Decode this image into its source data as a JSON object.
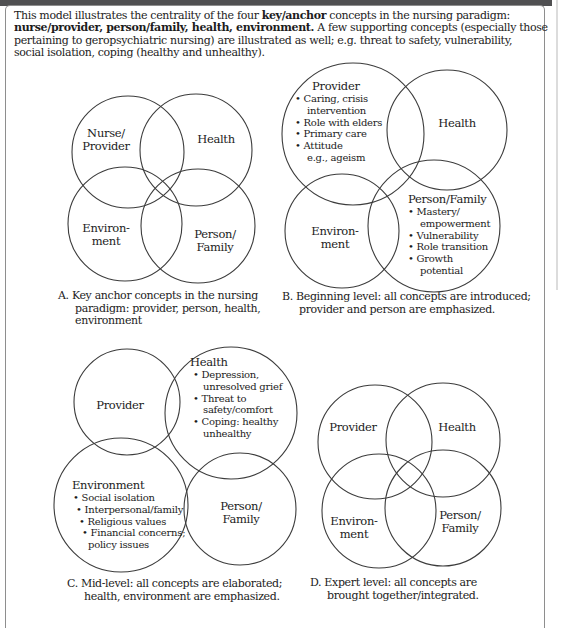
{
  "colors": {
    "ink": "#1c1c1c",
    "circle_stroke": "#3c3c3c",
    "frame_border": "#8e8e8e",
    "top_bar": "#505052",
    "background": "#ffffff"
  },
  "intro": {
    "line1_a": "This model illustrates the centrality of the four ",
    "line1_b": "key/anchor",
    "line1_c": " concepts in the nursing paradigm:",
    "line2_a": "nurse/provider, person/family, health, environment.",
    "line2_b": " A few supporting concepts (especially those",
    "line3": "pertaining to geropsychiatric nursing) are illustrated as well; e.g. threat to safety, vulnerability,",
    "line4": "social isolation, coping (healthy and unhealthy)."
  },
  "panel_a": {
    "labels": {
      "nurse_provider_1": "Nurse/",
      "nurse_provider_2": "Provider",
      "health": "Health",
      "environment_1": "Environ-",
      "environment_2": "ment",
      "person_family_1": "Person/",
      "person_family_2": "Family"
    },
    "caption_1": "A. Key anchor concepts in the nursing",
    "caption_2": "paradigm: provider, person, health,",
    "caption_3": "environment"
  },
  "panel_b": {
    "provider_title": "Provider",
    "provider_bullets": [
      "• Caring, crisis",
      "intervention",
      "• Role with elders",
      "• Primary care",
      "• Attitude",
      "e.g., ageism"
    ],
    "health": "Health",
    "environment_1": "Environ-",
    "environment_2": "ment",
    "person_family_title": "Person/Family",
    "person_family_bullets": [
      "• Mastery/",
      "empowerment",
      "• Vulnerability",
      "• Role transition",
      "• Growth",
      "potential"
    ],
    "caption_1": "B. Beginning level: all concepts are introduced;",
    "caption_2": "provider and person are emphasized."
  },
  "panel_c": {
    "provider": "Provider",
    "health_title": "Health",
    "health_bullets": [
      "• Depression,",
      "unresolved grief",
      "• Threat to",
      "safety/comfort",
      "• Coping: healthy",
      "unhealthy"
    ],
    "environment_title": "Environment",
    "environment_bullets": [
      "• Social isolation",
      "• Interpersonal/family",
      "• Religious values",
      "• Financial concerns;",
      "policy issues"
    ],
    "person_family_1": "Person/",
    "person_family_2": "Family",
    "caption_1": "C. Mid-level: all concepts are elaborated;",
    "caption_2": "health, environment are emphasized."
  },
  "panel_d": {
    "provider": "Provider",
    "health": "Health",
    "environment_1": "Environ-",
    "environment_2": "ment",
    "person_family_1": "Person/",
    "person_family_2": "Family",
    "caption_1": "D. Expert level: all concepts are",
    "caption_2": "brought together/integrated."
  }
}
